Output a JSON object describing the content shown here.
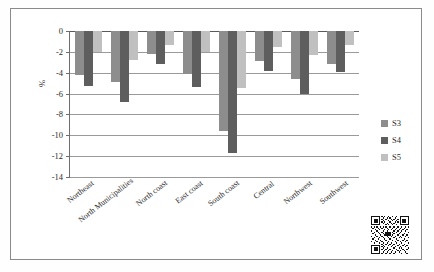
{
  "chart_data": {
    "type": "bar",
    "title": "",
    "subtitle": "",
    "xlabel": "",
    "ylabel": "%",
    "ylim": [
      -14,
      0
    ],
    "yticks": [
      0,
      -2,
      -4,
      -6,
      -8,
      -10,
      -12,
      -14
    ],
    "ytick_labels": [
      "0",
      "-2",
      "-4",
      "-6",
      "-8",
      "-10",
      "-12",
      "-14"
    ],
    "grid": true,
    "legend_position": "right",
    "categories": [
      "Northeast",
      "North Municipalities",
      "North coast",
      "East coast",
      "South coast",
      "Central",
      "Northwest",
      "Southwest"
    ],
    "series": [
      {
        "name": "S3",
        "color": "#8d8d8d",
        "values": [
          -4.2,
          -4.9,
          -2.2,
          -4.1,
          -9.6,
          -2.9,
          -4.6,
          -3.2
        ]
      },
      {
        "name": "S4",
        "color": "#5e5e5e",
        "values": [
          -5.3,
          -6.8,
          -3.2,
          -5.4,
          -11.7,
          -3.8,
          -6.0,
          -3.9
        ]
      },
      {
        "name": "S5",
        "color": "#c0c0c0",
        "values": [
          -2.0,
          -2.8,
          -1.3,
          -2.0,
          -5.5,
          -1.5,
          -2.3,
          -1.3
        ]
      }
    ]
  },
  "legend": {
    "items": [
      {
        "label": "S3",
        "swatch": "s3"
      },
      {
        "label": "S4",
        "swatch": "s4"
      },
      {
        "label": "S5",
        "swatch": "s5"
      }
    ]
  },
  "decorations": {
    "qr_code": "qr-code-icon"
  }
}
